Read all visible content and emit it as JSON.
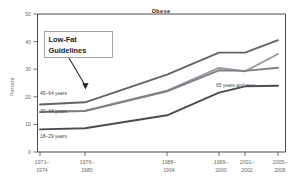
{
  "chart_data": {
    "type": "line",
    "title": "Obese",
    "xlabel": "",
    "ylabel": "Percent",
    "ylim": [
      0,
      50
    ],
    "yticks": [
      0,
      10,
      20,
      30,
      40,
      50
    ],
    "grid": false,
    "legend_position": "inline-labels",
    "categories": [
      "1971–1974",
      "1976–1980",
      "1988–1994",
      "1999–2000",
      "2001–2002",
      "2005–2006"
    ],
    "category_lines": [
      [
        "1971–",
        "1974"
      ],
      [
        "1976–",
        "1980"
      ],
      [
        "1988–",
        "1994"
      ],
      [
        "1999–",
        "2000"
      ],
      [
        "2001–",
        "2002"
      ],
      [
        "2005–",
        "2006"
      ]
    ],
    "series": [
      {
        "name": "45–64 years",
        "color": "#63636a",
        "values": [
          17.2,
          18.0,
          28.0,
          36.0,
          36.0,
          40.5
        ]
      },
      {
        "name": "65 years and over",
        "color": "#9a9aa0",
        "values": [
          14.5,
          15.0,
          22.2,
          30.5,
          29.2,
          35.5
        ]
      },
      {
        "name": "30–44 years",
        "color": "#7f7f86",
        "values": [
          14.5,
          14.8,
          22.0,
          29.6,
          29.4,
          30.5
        ]
      },
      {
        "name": "18–29 years",
        "color": "#4c4c52",
        "values": [
          8.2,
          8.6,
          13.3,
          21.5,
          23.8,
          24.0
        ]
      }
    ],
    "annotations": [
      {
        "text_line1": "Low-Fat",
        "text_line2": "Guidelines",
        "points_to_category": "1976–1980"
      }
    ]
  },
  "axis": {
    "y_label": "Percent",
    "y_ticks": [
      "0",
      "10",
      "20",
      "30",
      "40",
      "50"
    ]
  },
  "series_labels": {
    "s45_64": "45–64 years",
    "s30_44": "30–44 years",
    "s18_29": "18–29 years",
    "s65_over": "65 years and over"
  },
  "annotation": {
    "line1": "Low-Fat",
    "line2": "Guidelines"
  }
}
